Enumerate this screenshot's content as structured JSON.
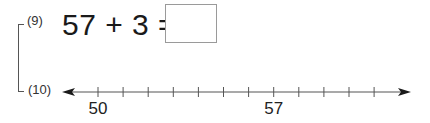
{
  "problems": [
    {
      "number": "(9)",
      "expression": "57 + 3 =",
      "answer": ""
    },
    {
      "number": "(10)"
    }
  ],
  "number_line": {
    "start_value": 50,
    "end_value": 61,
    "tick_count": 12,
    "labels": [
      {
        "value": 50,
        "text": "50"
      },
      {
        "value": 57,
        "text": "57"
      }
    ],
    "colors": {
      "line": "#555555",
      "arrow": "#1a1a1a"
    }
  }
}
